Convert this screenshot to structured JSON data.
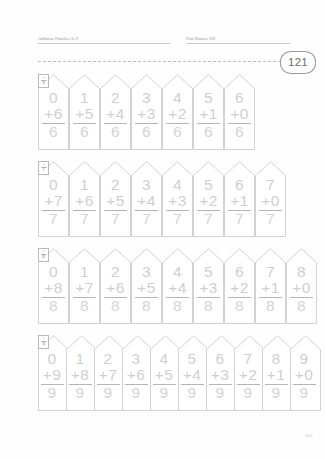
{
  "header": {
    "left_title": "Addition Families 6–9",
    "right_title": "Fact Houses #02",
    "page_badge": "121"
  },
  "footer": {
    "code": "6831"
  },
  "worksheet": {
    "operator": "+",
    "blocks": [
      {
        "tab_operator": "+",
        "tab_number": "6",
        "family": "6",
        "houses": [
          {
            "top": "0",
            "addend": "+6",
            "sum": "6"
          },
          {
            "top": "1",
            "addend": "+5",
            "sum": "6"
          },
          {
            "top": "2",
            "addend": "+4",
            "sum": "6"
          },
          {
            "top": "3",
            "addend": "+3",
            "sum": "6"
          },
          {
            "top": "4",
            "addend": "+2",
            "sum": "6"
          },
          {
            "top": "5",
            "addend": "+1",
            "sum": "6"
          },
          {
            "top": "6",
            "addend": "+0",
            "sum": "6"
          }
        ]
      },
      {
        "tab_operator": "+",
        "tab_number": "7",
        "family": "7",
        "houses": [
          {
            "top": "0",
            "addend": "+7",
            "sum": "7"
          },
          {
            "top": "1",
            "addend": "+6",
            "sum": "7"
          },
          {
            "top": "2",
            "addend": "+5",
            "sum": "7"
          },
          {
            "top": "3",
            "addend": "+4",
            "sum": "7"
          },
          {
            "top": "4",
            "addend": "+3",
            "sum": "7"
          },
          {
            "top": "5",
            "addend": "+2",
            "sum": "7"
          },
          {
            "top": "6",
            "addend": "+1",
            "sum": "7"
          },
          {
            "top": "7",
            "addend": "+0",
            "sum": "7"
          }
        ]
      },
      {
        "tab_operator": "+",
        "tab_number": "8",
        "family": "8",
        "houses": [
          {
            "top": "0",
            "addend": "+8",
            "sum": "8"
          },
          {
            "top": "1",
            "addend": "+7",
            "sum": "8"
          },
          {
            "top": "2",
            "addend": "+6",
            "sum": "8"
          },
          {
            "top": "3",
            "addend": "+5",
            "sum": "8"
          },
          {
            "top": "4",
            "addend": "+4",
            "sum": "8"
          },
          {
            "top": "5",
            "addend": "+3",
            "sum": "8"
          },
          {
            "top": "6",
            "addend": "+2",
            "sum": "8"
          },
          {
            "top": "7",
            "addend": "+1",
            "sum": "8"
          },
          {
            "top": "8",
            "addend": "+0",
            "sum": "8"
          }
        ]
      },
      {
        "tab_operator": "+",
        "tab_number": "9",
        "family": "9",
        "houses": [
          {
            "top": "0",
            "addend": "+9",
            "sum": "9"
          },
          {
            "top": "1",
            "addend": "+8",
            "sum": "9"
          },
          {
            "top": "2",
            "addend": "+7",
            "sum": "9"
          },
          {
            "top": "3",
            "addend": "+6",
            "sum": "9"
          },
          {
            "top": "4",
            "addend": "+5",
            "sum": "9"
          },
          {
            "top": "5",
            "addend": "+4",
            "sum": "9"
          },
          {
            "top": "6",
            "addend": "+3",
            "sum": "9"
          },
          {
            "top": "7",
            "addend": "+2",
            "sum": "9"
          },
          {
            "top": "8",
            "addend": "+1",
            "sum": "9"
          },
          {
            "top": "9",
            "addend": "+0",
            "sum": "9"
          }
        ]
      }
    ]
  }
}
